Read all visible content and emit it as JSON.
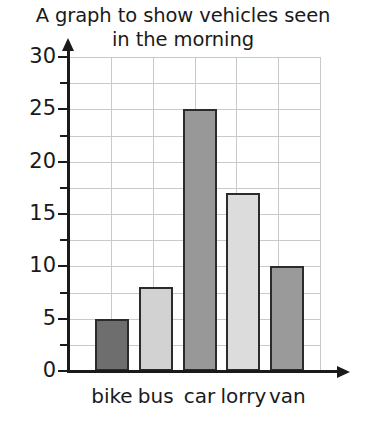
{
  "chart_data": {
    "type": "bar",
    "title": "A graph to show vehicles seen in the morning",
    "title_lines": [
      "A graph to show vehicles seen",
      "in the morning"
    ],
    "categories": [
      "bike",
      "bus",
      "car",
      "lorry",
      "van"
    ],
    "values": [
      5,
      8,
      25,
      17,
      10
    ],
    "xlabel": "",
    "ylabel": "",
    "ylim": [
      0,
      30
    ],
    "y_ticks": [
      0,
      5,
      10,
      15,
      20,
      25,
      30
    ],
    "y_tick_labels": [
      "0",
      "5",
      "10",
      "15",
      "20",
      "25",
      "30"
    ],
    "y_minor_tick_step": 2.5,
    "grid": true,
    "grid_axis": "both",
    "legend": false,
    "bar_colors": [
      "#6e6e6e",
      "#d2d2d2",
      "#989898",
      "#dcdcdc",
      "#9a9a9a"
    ],
    "bar_edge_color": "#2b2b2b",
    "grid_color": "#c9c9c9",
    "axis_color": "#1a1a1a",
    "background_color": "#ffffff"
  }
}
